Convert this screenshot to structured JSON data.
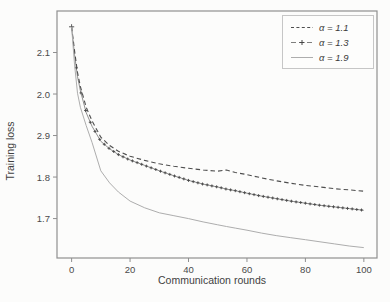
{
  "figure": {
    "y_axis_title": "Training loss",
    "x_axis_title": "Communication rounds"
  },
  "chart_data": {
    "type": "line",
    "title": "",
    "xlabel": "Communication rounds",
    "ylabel": "Training loss",
    "xlim": [
      -5,
      104.5
    ],
    "ylim": [
      1.605,
      2.2
    ],
    "grid": false,
    "legend_position": "upper right",
    "x_ticks": [
      0,
      20,
      40,
      60,
      80,
      100
    ],
    "y_ticks": [
      {
        "value": 2.1,
        "label": "2.1"
      },
      {
        "value": 2.0,
        "label": "2.0"
      },
      {
        "value": 1.9,
        "label": "2.9"
      },
      {
        "value": 1.8,
        "label": "1.8"
      },
      {
        "value": 1.7,
        "label": "1.7"
      }
    ],
    "x": [
      0,
      1,
      2,
      3,
      5,
      7,
      10,
      13,
      16,
      20,
      25,
      30,
      35,
      40,
      45,
      50,
      53,
      56,
      60,
      65,
      70,
      75,
      80,
      85,
      90,
      95,
      100
    ],
    "series": [
      {
        "name": "α = 1.1",
        "style": "dashed",
        "marker": "none",
        "color": "#4e4e4e",
        "values": [
          2.162,
          2.105,
          2.052,
          2.018,
          1.968,
          1.935,
          1.896,
          1.876,
          1.862,
          1.85,
          1.84,
          1.832,
          1.826,
          1.821,
          1.817,
          1.814,
          1.817,
          1.811,
          1.806,
          1.798,
          1.791,
          1.785,
          1.78,
          1.776,
          1.772,
          1.769,
          1.766
        ]
      },
      {
        "name": "α = 1.3",
        "style": "solid",
        "marker": "plus",
        "color": "#474747",
        "values": [
          2.162,
          2.095,
          2.042,
          2.008,
          1.955,
          1.922,
          1.886,
          1.868,
          1.854,
          1.841,
          1.828,
          1.815,
          1.803,
          1.792,
          1.783,
          1.776,
          1.771,
          1.767,
          1.761,
          1.754,
          1.748,
          1.742,
          1.737,
          1.732,
          1.728,
          1.724,
          1.72
        ]
      },
      {
        "name": "α = 1.9",
        "style": "solid",
        "marker": "none",
        "color": "#adadad",
        "values": [
          2.162,
          2.072,
          2.002,
          1.968,
          1.924,
          1.883,
          1.815,
          1.786,
          1.764,
          1.742,
          1.726,
          1.714,
          1.707,
          1.7,
          1.692,
          1.685,
          1.681,
          1.677,
          1.672,
          1.665,
          1.659,
          1.654,
          1.649,
          1.644,
          1.639,
          1.634,
          1.63
        ]
      }
    ]
  }
}
